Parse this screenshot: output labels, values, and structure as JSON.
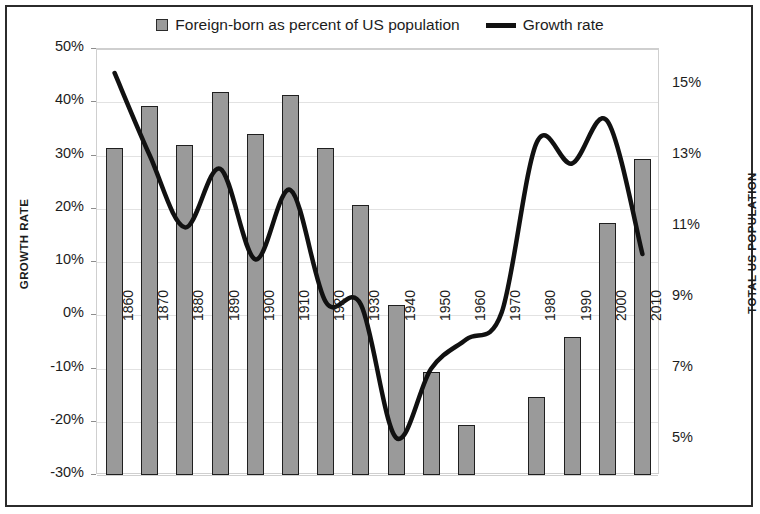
{
  "legend": {
    "entries": [
      {
        "label": "Foreign-born as percent of US population",
        "marker": "bar-swatch-icon",
        "color": "#9a9a9a"
      },
      {
        "label": "Growth rate",
        "marker": "line-swatch-icon",
        "color": "#111111"
      }
    ]
  },
  "axes": {
    "left_title": "GROWTH RATE",
    "right_title": "TOTAL US POPULATION",
    "left_ticks": [
      "50%",
      "40%",
      "30%",
      "20%",
      "10%",
      "0%",
      "-10%",
      "-20%",
      "-30%"
    ],
    "right_ticks": [
      "15%",
      "13%",
      "11%",
      "9%",
      "7%",
      "5%"
    ]
  },
  "chart_data": {
    "type": "bar",
    "title": "",
    "xlabel": "",
    "ylabel": "GROWTH RATE",
    "y2label": "TOTAL US POPULATION",
    "ylim": [
      -30,
      50
    ],
    "y2lim": [
      4.0,
      16.0
    ],
    "yticks": [
      50,
      40,
      30,
      20,
      10,
      0,
      -10,
      -20,
      -30
    ],
    "y2ticks": [
      15,
      13,
      11,
      9,
      7,
      5
    ],
    "grid": true,
    "legend_position": "top-center",
    "categories": [
      "1860",
      "1870",
      "1880",
      "1890",
      "1900",
      "1910",
      "1920",
      "1930",
      "1940",
      "1950",
      "1960",
      "1970",
      "1980",
      "1990",
      "2000",
      "2010"
    ],
    "series": [
      {
        "name": "Foreign-born as percent of US population",
        "type": "bar",
        "axis": "right",
        "color": "#9a9a9a",
        "values": [
          13.2,
          14.4,
          13.3,
          14.8,
          13.6,
          14.7,
          13.2,
          11.6,
          8.8,
          6.9,
          5.4,
          null,
          6.2,
          7.9,
          11.1,
          12.9
        ]
      },
      {
        "name": "Growth rate",
        "type": "line",
        "axis": "left",
        "color": "#111111",
        "values": [
          45.5,
          30.0,
          16.5,
          27.5,
          10.5,
          23.5,
          2.5,
          2.0,
          -23.0,
          -10.0,
          -4.5,
          0.5,
          32.5,
          28.5,
          36.5,
          11.5
        ]
      }
    ]
  }
}
